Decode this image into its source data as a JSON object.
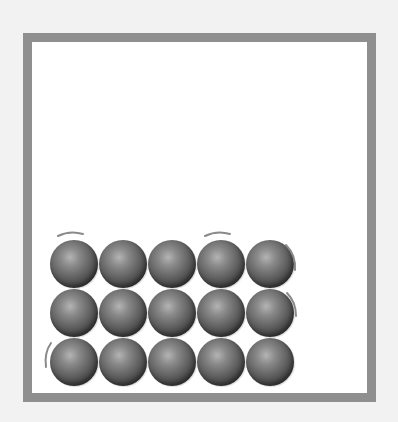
{
  "figure": {
    "colors": {
      "background": "#f2f2f2",
      "container_border": "#8f8f8f",
      "container_fill": "#ffffff",
      "particle_highlight": "#b4b4b4",
      "particle_shadow": "#2a2a2a",
      "vibration_mark": "#8a8a8a"
    },
    "container": {
      "x": 23,
      "y": 33,
      "width": 353,
      "height": 369,
      "border": 9
    },
    "particles": {
      "rows": 3,
      "columns": 5,
      "diameter": 48,
      "pitch": 49,
      "origin": {
        "x": 50,
        "y": 240
      },
      "items": [
        {
          "row": 0,
          "col": 0
        },
        {
          "row": 0,
          "col": 1
        },
        {
          "row": 0,
          "col": 2
        },
        {
          "row": 0,
          "col": 3
        },
        {
          "row": 0,
          "col": 4
        },
        {
          "row": 1,
          "col": 0
        },
        {
          "row": 1,
          "col": 1
        },
        {
          "row": 1,
          "col": 2
        },
        {
          "row": 1,
          "col": 3
        },
        {
          "row": 1,
          "col": 4
        },
        {
          "row": 2,
          "col": 0
        },
        {
          "row": 2,
          "col": 1
        },
        {
          "row": 2,
          "col": 2
        },
        {
          "row": 2,
          "col": 3
        },
        {
          "row": 2,
          "col": 4
        }
      ]
    },
    "vibration_marks": [
      {
        "particle": "row0-col0",
        "side": "top"
      },
      {
        "particle": "row0-col3",
        "side": "top"
      },
      {
        "particle": "row0-col4",
        "side": "right"
      },
      {
        "particle": "row1-col4",
        "side": "right"
      },
      {
        "particle": "row2-col0",
        "side": "left"
      }
    ]
  }
}
